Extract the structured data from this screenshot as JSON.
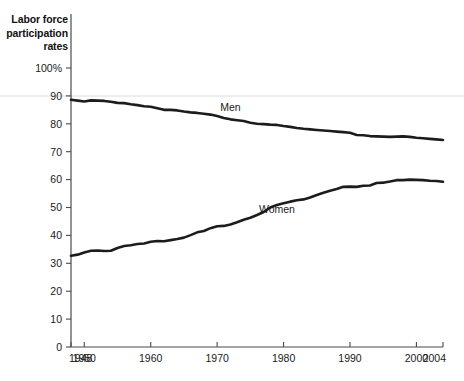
{
  "chart_data": {
    "type": "line",
    "title": "Labor force\nparticipation\nrates",
    "xlabel": "",
    "ylabel": "",
    "xlim": [
      1948,
      2004
    ],
    "ylim": [
      0,
      100
    ],
    "grid": false,
    "legend_position": "inline-labels",
    "y_ticks": [
      "0",
      "10",
      "20",
      "30",
      "40",
      "50",
      "60",
      "70",
      "80",
      "90",
      "100%"
    ],
    "y_tick_values": [
      0,
      10,
      20,
      30,
      40,
      50,
      60,
      70,
      80,
      90,
      100
    ],
    "x_ticks": [
      "1948",
      "1950",
      "1960",
      "1970",
      "1980",
      "1990",
      "2000",
      "2004"
    ],
    "x_tick_values": [
      1948,
      1950,
      1960,
      1970,
      1980,
      1990,
      2000,
      2004
    ],
    "x": [
      1948,
      1949,
      1950,
      1951,
      1952,
      1953,
      1954,
      1955,
      1956,
      1957,
      1958,
      1959,
      1960,
      1961,
      1962,
      1963,
      1964,
      1965,
      1966,
      1967,
      1968,
      1969,
      1970,
      1971,
      1972,
      1973,
      1974,
      1975,
      1976,
      1977,
      1978,
      1979,
      1980,
      1981,
      1982,
      1983,
      1984,
      1985,
      1986,
      1987,
      1988,
      1989,
      1990,
      1991,
      1992,
      1993,
      1994,
      1995,
      1996,
      1997,
      1998,
      1999,
      2000,
      2001,
      2002,
      2003,
      2004
    ],
    "series": [
      {
        "name": "Men",
        "label": "Men",
        "color": "#1c1c1c",
        "label_x": 1972,
        "label_y": 84.5,
        "values": [
          88.6,
          88.3,
          88.0,
          88.4,
          88.3,
          88.2,
          87.9,
          87.5,
          87.4,
          87.0,
          86.7,
          86.3,
          86.1,
          85.6,
          85.0,
          85.0,
          84.8,
          84.4,
          84.1,
          83.9,
          83.6,
          83.3,
          82.8,
          82.1,
          81.6,
          81.3,
          81.0,
          80.4,
          80.0,
          79.9,
          79.7,
          79.6,
          79.2,
          78.9,
          78.5,
          78.2,
          78.0,
          77.8,
          77.6,
          77.4,
          77.2,
          77.0,
          76.8,
          76.0,
          75.9,
          75.6,
          75.5,
          75.4,
          75.3,
          75.4,
          75.5,
          75.3,
          75.0,
          74.8,
          74.6,
          74.4,
          74.2
        ]
      },
      {
        "name": "Women",
        "label": "Women",
        "color": "#1c1c1c",
        "label_x": 1979,
        "label_y": 48.0,
        "values": [
          32.7,
          33.1,
          33.9,
          34.5,
          34.6,
          34.4,
          34.5,
          35.5,
          36.2,
          36.5,
          36.9,
          37.1,
          37.7,
          38.0,
          37.9,
          38.3,
          38.7,
          39.2,
          40.1,
          41.1,
          41.6,
          42.6,
          43.3,
          43.4,
          43.9,
          44.7,
          45.6,
          46.3,
          47.3,
          48.4,
          50.0,
          50.9,
          51.5,
          52.1,
          52.6,
          52.9,
          53.6,
          54.5,
          55.3,
          56.0,
          56.6,
          57.4,
          57.5,
          57.4,
          57.8,
          57.9,
          58.8,
          58.9,
          59.3,
          59.8,
          59.8,
          60.0,
          59.9,
          59.8,
          59.6,
          59.5,
          59.2
        ]
      }
    ]
  }
}
